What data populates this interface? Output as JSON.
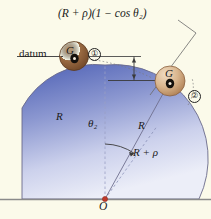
{
  "figure": {
    "type": "mechanics-free-body-diagram",
    "background_color": "#fbfaea",
    "dome_color_top": "#5b6cba",
    "dome_color_bottom": "#e8e9f6",
    "ball1_color": "#9a6b42",
    "ball2_color": "#d8b48c",
    "baseline_color": "#8a8a8a"
  },
  "labels": {
    "height_equation": "(R + ρ)(1 − cos θ₂)",
    "datum": "datum",
    "position_1": "①",
    "position_2": "②",
    "center_of_mass_1": "G",
    "center_of_mass_2": "G",
    "radius_vertical": "R",
    "radius_angled": "R",
    "radius_plus_rho": "R + ρ",
    "angle": "θ₂",
    "origin": "O"
  },
  "annotations": {
    "equation_parts": {
      "outer_radius": "R + ρ",
      "factor": "1 − cos θ₂"
    },
    "geometry": {
      "dome_radius": "R",
      "ball_radius": "ρ",
      "center_distance_from_O": "R + ρ",
      "angle_from_vertical": "θ₂"
    }
  }
}
